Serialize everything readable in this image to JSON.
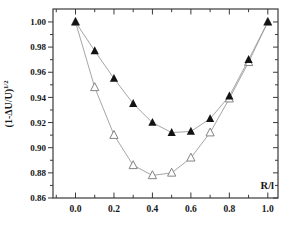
{
  "figure": {
    "background": "#ffffff",
    "frame_color": "#3a3a3a",
    "line_color": "#9b9b9b",
    "marker_filled_color": "#131313",
    "marker_open_fill": "#ffffff",
    "marker_open_stroke": "#848484",
    "text_color": "#161616"
  },
  "chart_data": {
    "type": "line",
    "title": "",
    "xlabel": "R/l",
    "ylabel": {
      "base": "(1-ΔU/U)",
      "sup": "1/2"
    },
    "xlim": [
      -0.117,
      1.053
    ],
    "ylim": [
      0.86,
      1.0103
    ],
    "grid": false,
    "legend": null,
    "x_axis": {
      "major_ticks": [
        0.0,
        0.2,
        0.4,
        0.6,
        0.8,
        1.0
      ],
      "major_labels": [
        "0.0",
        "0.2",
        "0.4",
        "0.6",
        "0.8",
        "1.0"
      ],
      "minor_ticks": [
        -0.1,
        0.1,
        0.3,
        0.5,
        0.7,
        0.9
      ]
    },
    "y_axis": {
      "major_ticks": [
        0.86,
        0.88,
        0.9,
        0.92,
        0.94,
        0.96,
        0.98,
        1.0
      ],
      "major_labels": [
        "0.86",
        "0.88",
        "0.90",
        "0.92",
        "0.94",
        "0.96",
        "0.98",
        "1.00"
      ],
      "minor_ticks": [
        0.87,
        0.89,
        0.91,
        0.93,
        0.95,
        0.97,
        0.99
      ]
    },
    "series": [
      {
        "name": "open-triangles",
        "marker": "triangle-open",
        "x": [
          0.0,
          0.1,
          0.2,
          0.3,
          0.4,
          0.5,
          0.6,
          0.7,
          0.8,
          0.9,
          1.0
        ],
        "y": [
          1.0,
          0.948,
          0.91,
          0.886,
          0.878,
          0.88,
          0.892,
          0.912,
          0.939,
          0.968,
          1.0
        ]
      },
      {
        "name": "filled-triangles",
        "marker": "triangle-filled",
        "x": [
          0.0,
          0.1,
          0.2,
          0.3,
          0.4,
          0.5,
          0.6,
          0.7,
          0.8,
          0.9,
          1.0
        ],
        "y": [
          1.0,
          0.977,
          0.955,
          0.935,
          0.92,
          0.912,
          0.913,
          0.923,
          0.941,
          0.97,
          1.0
        ]
      }
    ]
  }
}
